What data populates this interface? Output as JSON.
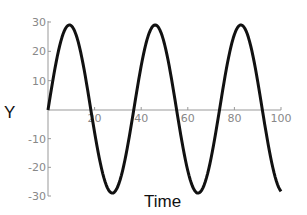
{
  "chart_data": {
    "type": "line",
    "title": "",
    "xlabel": "Time",
    "ylabel": "Y",
    "xlim": [
      0,
      100
    ],
    "ylim": [
      -30,
      30
    ],
    "xticks": [
      20,
      40,
      60,
      80,
      100
    ],
    "yticks": [
      -30,
      -20,
      -10,
      10,
      20,
      30
    ],
    "grid": false,
    "legend": null,
    "series": [
      {
        "name": "Y",
        "function": "29*sin(2*pi*t/36.8)",
        "amplitude": 29,
        "period": 36.8,
        "x": [
          0,
          4.6,
          9.2,
          13.8,
          18.4,
          23,
          27.6,
          32.2,
          36.8,
          41.4,
          46,
          50.6,
          55.2,
          59.8,
          64.4,
          69,
          73.6,
          78.2,
          82.8,
          87.4,
          92,
          96.6,
          100
        ],
        "values": [
          0,
          20.5,
          29,
          20.5,
          0,
          -20.5,
          -29,
          -20.5,
          0,
          20.5,
          29,
          20.5,
          0,
          -20.5,
          -29,
          -20.5,
          0,
          20.5,
          29,
          20.5,
          0,
          -20.5,
          -28
        ]
      }
    ],
    "color": "#111111"
  },
  "labels": {
    "x_axis": "Time",
    "y_axis": "Y",
    "xtick_labels": [
      "20",
      "40",
      "60",
      "80",
      "100"
    ],
    "ytick_labels": [
      "30",
      "20",
      "10",
      "-10",
      "-20",
      "-30"
    ]
  }
}
